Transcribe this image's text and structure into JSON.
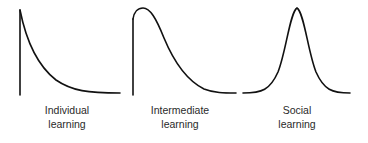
{
  "panels": [
    {
      "id": "individual",
      "label_line1": "Individual",
      "label_line2": "learning",
      "shape": "vertical-onset-exponential-decay"
    },
    {
      "id": "intermediate",
      "label_line1": "Intermediate",
      "label_line2": "learning",
      "shape": "vertical-onset-right-skewed-peak"
    },
    {
      "id": "social",
      "label_line1": "Social",
      "label_line2": "learning",
      "shape": "symmetric-bell-curve"
    }
  ],
  "colors": {
    "stroke": "#111111",
    "text": "#2a2a2a",
    "background": "#ffffff"
  }
}
